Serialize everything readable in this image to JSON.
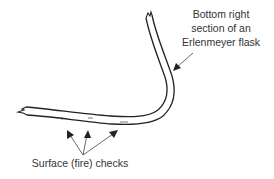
{
  "diagram": {
    "labels": {
      "flask_line1": "Bottom right",
      "flask_line2": "section of an",
      "flask_line3": "Erlenmeyer flask",
      "checks": "Surface (fire) checks"
    },
    "colors": {
      "stroke": "#222222",
      "text": "#333333",
      "background": "#ffffff"
    }
  }
}
